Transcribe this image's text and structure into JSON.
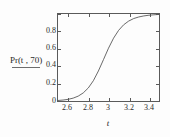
{
  "chart_data": {
    "type": "line",
    "title": "",
    "xlabel": "t",
    "ylabel": "Pr(t , 70)",
    "xlim": [
      2.5,
      3.5
    ],
    "ylim": [
      0.0,
      1.0
    ],
    "grid": false,
    "legend_position": "left-outside",
    "legend_entries": [
      "Pr(t , 70)"
    ],
    "line_color": "#555555",
    "xticks": [
      2.6,
      2.8,
      3,
      3.2,
      3.4
    ],
    "xtick_labels": [
      "2.6",
      "2.8",
      "3",
      "3.2",
      "3.4"
    ],
    "yticks": [
      0,
      0.2,
      0.4,
      0.6,
      0.8
    ],
    "ytick_labels": [
      "0",
      "0.2",
      "0.4",
      "0.6",
      "0.8"
    ],
    "series": [
      {
        "name": "Pr(t , 70)",
        "x": [
          2.5,
          2.55,
          2.6,
          2.65,
          2.7,
          2.75,
          2.8,
          2.85,
          2.9,
          2.95,
          3.0,
          3.05,
          3.1,
          3.15,
          3.2,
          3.25,
          3.3,
          3.35,
          3.4,
          3.45,
          3.5
        ],
        "y": [
          0.006,
          0.011,
          0.019,
          0.033,
          0.056,
          0.093,
          0.15,
          0.233,
          0.345,
          0.475,
          0.607,
          0.722,
          0.812,
          0.876,
          0.919,
          0.948,
          0.966,
          0.978,
          0.986,
          0.991,
          0.995
        ]
      }
    ]
  },
  "axes": {
    "y_label_text": "Pr(t , 70)",
    "x_label_text": "t",
    "y_tick_0": "0",
    "y_tick_1": "0.2",
    "y_tick_2": "0.4",
    "y_tick_3": "0.6",
    "y_tick_4": "0.8",
    "x_tick_0": "2.6",
    "x_tick_1": "2.8",
    "x_tick_2": "3",
    "x_tick_3": "3.2",
    "x_tick_4": "3.4"
  },
  "colors": {
    "curve": "#555555",
    "frame": "#5a5a5a",
    "text": "#2b2b2b",
    "background": "#fdfdfd"
  }
}
